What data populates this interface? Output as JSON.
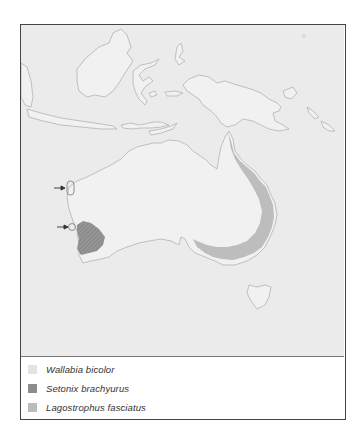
{
  "map": {
    "title": "",
    "region": "Australia and Indonesia / New Guinea",
    "colors": {
      "sea": "#ebebeb",
      "land": "#f2f2f2",
      "coastline": "#b4b4b4",
      "wallabia_bicolor": "#e6e6e6",
      "setonix_brachyurus": "#8a8a8a",
      "lagostrophus_fasciatus": "#bdbdbd",
      "frame": "#444444"
    },
    "annotations": [
      {
        "type": "arrow",
        "target": "islands-west-coast-north",
        "name": "arrow-shark-bay-islands"
      },
      {
        "type": "arrow",
        "target": "rottnest-island",
        "name": "arrow-rottnest-island"
      }
    ]
  },
  "legend": {
    "items": [
      {
        "label": "Wallabia bicolor",
        "color": "#e3e3e3"
      },
      {
        "label": "Setonix brachyurus",
        "color": "#8c8c8c"
      },
      {
        "label": "Lagostrophus fasciatus",
        "color": "#bcbcbc"
      }
    ]
  }
}
